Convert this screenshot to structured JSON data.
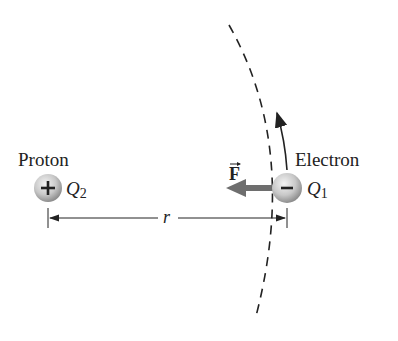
{
  "proton": {
    "label": "Proton",
    "charge_symbol": "Q",
    "charge_sub": "2",
    "sign": "+"
  },
  "electron": {
    "label": "Electron",
    "charge_symbol": "Q",
    "charge_sub": "1",
    "sign": "−"
  },
  "force": {
    "label": "F"
  },
  "distance": {
    "label": "r"
  },
  "colors": {
    "ink": "#222222",
    "arrow": "#6e6e6e",
    "sphere_light": "#f2f2f2",
    "sphere_dark": "#9a9a9a"
  }
}
